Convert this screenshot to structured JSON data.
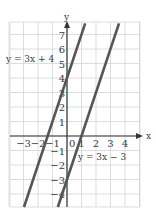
{
  "chart_data": {
    "type": "line",
    "title": "",
    "xlabel": "x",
    "ylabel": "y",
    "xlim": [
      -4,
      5
    ],
    "ylim": [
      -5,
      8
    ],
    "grid": true,
    "x_ticks": [
      -3,
      -2,
      -1,
      0,
      1,
      2,
      3,
      4
    ],
    "y_ticks": [
      -4,
      -3,
      -2,
      -1,
      1,
      2,
      3,
      4,
      5,
      6,
      7
    ],
    "x_tick_labels": [
      "−3",
      "−2",
      "−1",
      "0",
      "1",
      "2",
      "3",
      "4"
    ],
    "y_tick_labels": [
      "−4",
      "−3",
      "−2",
      "−1",
      "1",
      "2",
      "3",
      "4",
      "5",
      "6",
      "7"
    ],
    "series": [
      {
        "name": "y = 3x + 4",
        "slope": 3,
        "intercept": 4,
        "color": "#555555"
      },
      {
        "name": "y = 3x − 3",
        "slope": 3,
        "intercept": -3,
        "color": "#555555"
      }
    ],
    "annotations": [
      {
        "text": "y = 3x + 4",
        "near_series": 0,
        "position": "upper-left"
      },
      {
        "text": "y = 3x − 3",
        "near_series": 1,
        "position": "lower-right"
      }
    ]
  },
  "style": {
    "grid_color": "#d4d4d4",
    "axis_color": "#333333",
    "line_color": "#555555"
  },
  "labels": {
    "x_axis": "x",
    "y_axis": "y",
    "eq1": "y = 3x + 4",
    "eq2": "y = 3x − 3",
    "origin": "0"
  }
}
